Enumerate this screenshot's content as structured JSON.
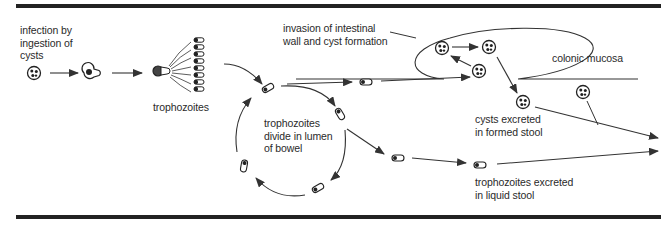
{
  "diagram": {
    "labels": {
      "infection": "infection by\ningestion of\ncysts",
      "trophozoites": "trophozoites",
      "invasion": "invasion of intestinal\nwall and cyst formation",
      "colonic_mucosa": "colonic mucosa",
      "divide": "trophozoites\ndivide in lumen\nof bowel",
      "cysts_excreted": "cysts excreted\nin formed stool",
      "trophozoites_excreted": "trophozoites excreted\nin liquid stool"
    },
    "colors": {
      "ink": "#2a2a2a",
      "rule": "#222222",
      "background": "#ffffff"
    },
    "icons": {
      "cyst": "cyst-icon",
      "excysting": "excysting-amoeba-icon",
      "trophozoite": "trophozoite-icon",
      "arrow": "arrow-icon"
    }
  }
}
